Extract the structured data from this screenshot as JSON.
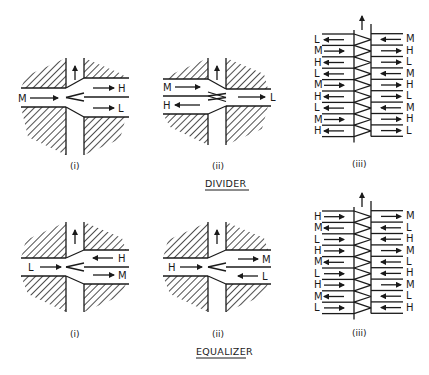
{
  "sections": [
    {
      "title": "DIVIDER",
      "panels": [
        {
          "caption": "(i)",
          "inlets": [
            {
              "label": "M",
              "dir": "in"
            }
          ],
          "outlets": [
            {
              "label": "H",
              "dir": "out"
            },
            {
              "label": "L",
              "dir": "out"
            }
          ]
        },
        {
          "caption": "(ii)",
          "inlets": [
            {
              "label": "M",
              "dir": "in"
            },
            {
              "label": "H",
              "dir": "out"
            }
          ],
          "outlets": [
            {
              "label": "L",
              "dir": "out"
            }
          ]
        },
        {
          "caption": "(iii)",
          "left": [
            {
              "label": "L",
              "dir": "left"
            },
            {
              "label": "M",
              "dir": "right"
            },
            {
              "label": "H",
              "dir": "left"
            },
            {
              "label": "L",
              "dir": "left"
            },
            {
              "label": "M",
              "dir": "right"
            },
            {
              "label": "H",
              "dir": "left"
            },
            {
              "label": "L",
              "dir": "left"
            },
            {
              "label": "M",
              "dir": "right"
            },
            {
              "label": "H",
              "dir": "left"
            }
          ],
          "right": [
            {
              "label": "M",
              "dir": "left"
            },
            {
              "label": "H",
              "dir": "right"
            },
            {
              "label": "L",
              "dir": "right"
            },
            {
              "label": "M",
              "dir": "left"
            },
            {
              "label": "H",
              "dir": "right"
            },
            {
              "label": "L",
              "dir": "right"
            },
            {
              "label": "M",
              "dir": "left"
            },
            {
              "label": "H",
              "dir": "right"
            },
            {
              "label": "L",
              "dir": "right"
            }
          ]
        }
      ]
    },
    {
      "title": "EQUALIZER",
      "panels": [
        {
          "caption": "(i)",
          "inlets": [
            {
              "label": "L",
              "dir": "in"
            }
          ],
          "outlets": [
            {
              "label": "H",
              "dir": "in"
            },
            {
              "label": "M",
              "dir": "out"
            }
          ]
        },
        {
          "caption": "(ii)",
          "inlets": [
            {
              "label": "H",
              "dir": "in"
            }
          ],
          "outlets": [
            {
              "label": "M",
              "dir": "out"
            },
            {
              "label": "L",
              "dir": "in"
            }
          ]
        },
        {
          "caption": "(iii)",
          "left": [
            {
              "label": "H",
              "dir": "right"
            },
            {
              "label": "M",
              "dir": "left"
            },
            {
              "label": "L",
              "dir": "right"
            },
            {
              "label": "H",
              "dir": "right"
            },
            {
              "label": "M",
              "dir": "left"
            },
            {
              "label": "L",
              "dir": "right"
            },
            {
              "label": "H",
              "dir": "right"
            },
            {
              "label": "M",
              "dir": "left"
            },
            {
              "label": "L",
              "dir": "right"
            }
          ],
          "right": [
            {
              "label": "M",
              "dir": "right"
            },
            {
              "label": "L",
              "dir": "left"
            },
            {
              "label": "H",
              "dir": "left"
            },
            {
              "label": "M",
              "dir": "right"
            },
            {
              "label": "L",
              "dir": "left"
            },
            {
              "label": "H",
              "dir": "left"
            },
            {
              "label": "M",
              "dir": "right"
            },
            {
              "label": "L",
              "dir": "left"
            },
            {
              "label": "H",
              "dir": "left"
            }
          ]
        }
      ]
    }
  ]
}
